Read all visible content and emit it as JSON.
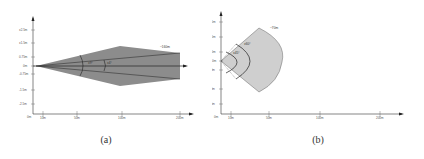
{
  "panels": [
    {
      "id": "a",
      "caption": "(a)",
      "y_ticks": [
        "±2.5m",
        "±1.5m",
        "0.75m",
        "0m",
        "-0.75m",
        "-1.5m",
        "-2.5m"
      ],
      "x_ticks": [
        "10m",
        "50m",
        "100m",
        "200m"
      ],
      "origin_label": "0m",
      "range_label": "~160m",
      "angle_labels": [
        "±9°",
        "±4°"
      ],
      "fill_color": "#8c8c8c"
    },
    {
      "id": "b",
      "caption": "(b)",
      "y_ticks": [
        "±25m",
        "±20m",
        "±10m",
        "0m",
        "-10m",
        "-20m",
        "-25m"
      ],
      "x_ticks": [
        "10m",
        "50m",
        "100m",
        "200m"
      ],
      "origin_label": "0m",
      "range_label": "~70m",
      "angle_labels": [
        "±60°",
        "±45°"
      ],
      "fill_color": "#cfcfcf"
    }
  ]
}
